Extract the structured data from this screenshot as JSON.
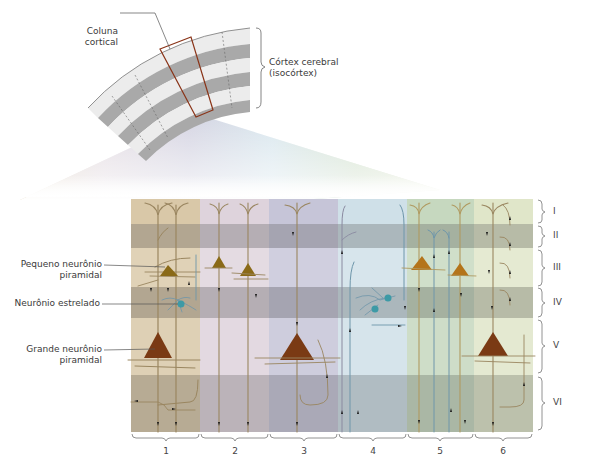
{
  "top_figure": {
    "column_label": [
      "Coluna",
      "cortical"
    ],
    "cortex_label": [
      "Córtex cerebral",
      "(isocórtex)"
    ]
  },
  "left_labels": {
    "small_pyramidal": [
      "Pequeno neurônio",
      "piramidal"
    ],
    "stellate": "Neurônio estrelado",
    "large_pyramidal": [
      "Grande neurônio",
      "piramidal"
    ]
  },
  "layers": [
    {
      "id": "I",
      "top": 199,
      "bottom": 224,
      "shade": "light"
    },
    {
      "id": "II",
      "top": 224,
      "bottom": 248,
      "shade": "dark"
    },
    {
      "id": "III",
      "top": 248,
      "bottom": 287,
      "shade": "light"
    },
    {
      "id": "IV",
      "top": 287,
      "bottom": 318,
      "shade": "dark"
    },
    {
      "id": "V",
      "top": 318,
      "bottom": 375,
      "shade": "light"
    },
    {
      "id": "VI",
      "top": 375,
      "bottom": 432,
      "shade": "dark"
    }
  ],
  "columns": [
    {
      "number": "1",
      "x0": 131,
      "x1": 200,
      "color": "#d9c8a8"
    },
    {
      "number": "2",
      "x0": 200,
      "x1": 269,
      "color": "#d8cdd6"
    },
    {
      "number": "3",
      "x0": 269,
      "x1": 338,
      "color": "#c3c2d6"
    },
    {
      "number": "4",
      "x0": 338,
      "x1": 407,
      "color": "#c8dce6"
    },
    {
      "number": "5",
      "x0": 407,
      "x1": 474,
      "color": "#c2d6bc"
    },
    {
      "number": "6",
      "x0": 474,
      "x1": 533,
      "color": "#dde4c6"
    }
  ],
  "colors": {
    "small_pyramidal": "#8a6a18",
    "large_pyramidal": "#7a3a14",
    "stellate": "#3d9aa6",
    "neuron_process": "#9a8660",
    "blue_process": "#6e96aa",
    "column_outline": "#8a3418",
    "cortex_band_dark": "#a9a9a9",
    "cortex_band_light": "#ececec"
  }
}
